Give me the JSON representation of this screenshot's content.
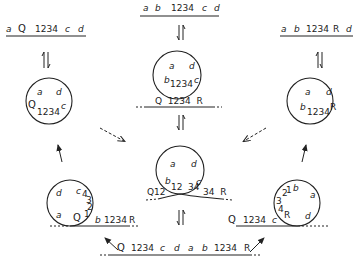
{
  "top_left": {
    "labels": [
      "a",
      "Q",
      "1234",
      "c",
      "d"
    ]
  },
  "top_center": {
    "labels": [
      "a",
      "b",
      "1234",
      "c",
      "d"
    ]
  },
  "top_right": {
    "labels": [
      "a",
      "b",
      "1234",
      "R",
      "d"
    ]
  },
  "circle_left_top": {
    "a": "a",
    "d": "d",
    "q": "Q",
    "n": "1234",
    "c": "c"
  },
  "circle_center_top": {
    "a": "a",
    "d": "d",
    "b": "b",
    "n": "1234",
    "c": "c",
    "line": "Q  1234  R"
  },
  "circle_right_top": {
    "a": "a",
    "d": "d",
    "b": "b",
    "n": "1234",
    "r": "R"
  },
  "circle_center_mid": {
    "a": "a",
    "d": "d",
    "b": "b",
    "n1": "12",
    "n2": "34",
    "c": "c",
    "left": "Q12",
    "right": "34  R"
  },
  "circle_left_bottom": {
    "d": "d",
    "c": "c",
    "n4": "4",
    "n3": "3",
    "n2": "2",
    "n1": "1",
    "q": "Q",
    "a": "a",
    "b": "b",
    "n": "1234",
    "r": "R"
  },
  "circle_right_bottom": {
    "n2": "2",
    "n1": "1",
    "b": "b",
    "a": "a",
    "n3": "3",
    "n4": "4",
    "r": "R",
    "d": "d",
    "c": "c",
    "q": "Q",
    "n": "1234"
  },
  "bottom": {
    "labels": [
      "Q",
      "1234",
      "c",
      "d",
      "a",
      "b",
      "1234",
      "R"
    ]
  }
}
